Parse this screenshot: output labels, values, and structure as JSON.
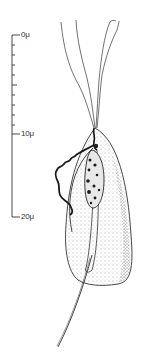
{
  "figure": {
    "ink_color": "#222222",
    "background": "#ffffff"
  },
  "scale_bar": {
    "unit": "μ",
    "labels": [
      {
        "text": "0μ",
        "value": 0
      },
      {
        "text": "10μ",
        "value": 10
      },
      {
        "text": "20μ",
        "value": 20
      }
    ],
    "minor_ticks_0_to_10": 9
  },
  "organism": {
    "anterior_flagella_count": 4,
    "parts": [
      "anterior-flagella",
      "undulating-membrane",
      "nucleus",
      "axostyle",
      "cell-body",
      "posterior-trailing-axostyle"
    ]
  }
}
